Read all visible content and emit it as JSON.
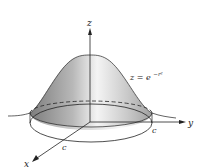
{
  "figure": {
    "equation": {
      "lhs": "z = e",
      "exponent": "−r²"
    },
    "axes": {
      "x_label": "x",
      "y_label": "y",
      "z_label": "z"
    },
    "radius_labels": {
      "on_y_axis": "c",
      "on_x_axis": "c"
    },
    "colors": {
      "surface_light": "#f2f2f2",
      "surface_dark": "#8a8a8a",
      "lines": "#222222",
      "background": "#ffffff"
    }
  }
}
